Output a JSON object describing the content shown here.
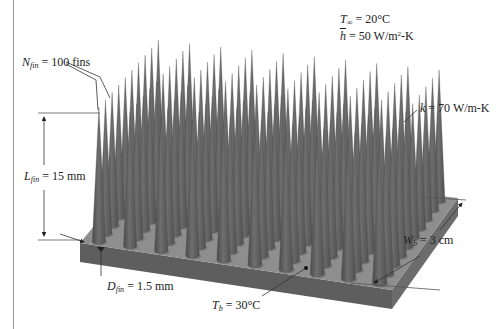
{
  "figure": {
    "type": "pin-fin heat sink schematic",
    "colors": {
      "fin": "#5a5a5a",
      "fin_light": "#7a7a7a",
      "base_top": "#8c8c8c",
      "base_front": "#5e5e5e",
      "base_side": "#6e6e6e",
      "annotation_line": "#333333"
    },
    "grid": {
      "rows": 10,
      "cols": 10
    }
  },
  "labels": {
    "t_inf": {
      "symbol": "T",
      "sub": "∞",
      "value": "= 20°C"
    },
    "h_bar": {
      "symbol": "h",
      "value": "= 50 W/m",
      "sup": "2",
      "unit_tail": "-K"
    },
    "n_fin": {
      "symbol": "N",
      "sub": "fin",
      "value": "= 100 fins"
    },
    "l_fin": {
      "symbol": "L",
      "sub": "fin",
      "value": "= 15 mm"
    },
    "k": {
      "symbol": "k",
      "value": "= 70 W/m-K"
    },
    "d_fin": {
      "symbol": "D",
      "sub": "fin",
      "value": "= 1.5 mm"
    },
    "t_b": {
      "symbol": "T",
      "sub": "b",
      "value": "= 30°C"
    },
    "w_b": {
      "symbol": "W",
      "sub": "b",
      "value": "= 3 cm"
    }
  }
}
